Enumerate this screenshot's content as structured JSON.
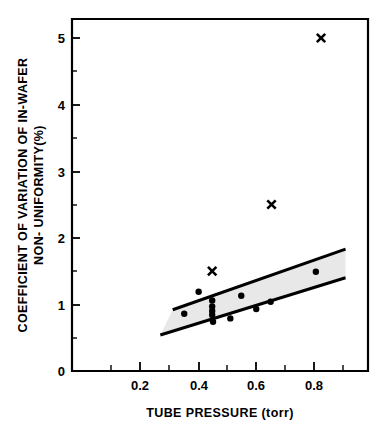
{
  "chart_data": {
    "type": "scatter",
    "title": "",
    "xlabel": "TUBE PRESSURE (torr)",
    "ylabel_line1": "COEFFICIENT OF VARIATION OF IN-WAFER",
    "ylabel_line2": "NON- UNIFORMITY(%)",
    "xlim": [
      0.0,
      0.993
    ],
    "ylim": [
      0.0,
      5.3
    ],
    "xticks": [
      0.2,
      0.4,
      0.6,
      0.8
    ],
    "xtick_labels": [
      "0.2",
      "0.4",
      "0.6",
      "0.8"
    ],
    "xticks_minor": [
      0.1,
      0.3,
      0.5,
      0.7,
      0.9
    ],
    "yticks": [
      0,
      1,
      2,
      3,
      4,
      5
    ],
    "ytick_labels": [
      "0",
      "1",
      "2",
      "3",
      "4",
      "5"
    ],
    "yticks_minor": [
      0.5,
      1.5,
      2.5,
      3.5,
      4.5
    ],
    "grid": false,
    "legend": null,
    "series": [
      {
        "name": "in-control runs",
        "marker": "filled-circle",
        "color": "#000000",
        "points": [
          {
            "x": 0.355,
            "y": 0.86
          },
          {
            "x": 0.405,
            "y": 1.19
          },
          {
            "x": 0.452,
            "y": 1.06
          },
          {
            "x": 0.452,
            "y": 0.97
          },
          {
            "x": 0.452,
            "y": 0.9
          },
          {
            "x": 0.452,
            "y": 0.84
          },
          {
            "x": 0.455,
            "y": 0.74
          },
          {
            "x": 0.515,
            "y": 0.79
          },
          {
            "x": 0.553,
            "y": 1.13
          },
          {
            "x": 0.605,
            "y": 0.93
          },
          {
            "x": 0.655,
            "y": 1.04
          },
          {
            "x": 0.812,
            "y": 1.49
          }
        ]
      },
      {
        "name": "out-of-control runs",
        "marker": "cross",
        "color": "#000000",
        "points": [
          {
            "x": 0.452,
            "y": 1.5
          },
          {
            "x": 0.658,
            "y": 2.5
          },
          {
            "x": 0.83,
            "y": 5.0
          }
        ]
      }
    ],
    "band": {
      "name": "control band",
      "fill_color": "#e8e8e8",
      "edge_color": "#000000",
      "upper_line": [
        {
          "x": 0.315,
          "y": 0.92
        },
        {
          "x": 0.915,
          "y": 1.83
        }
      ],
      "lower_line": [
        {
          "x": 0.272,
          "y": 0.54
        },
        {
          "x": 0.915,
          "y": 1.4
        }
      ]
    },
    "annotations": []
  },
  "figure": {
    "background": "#ffffff",
    "axis_color": "#000000"
  }
}
